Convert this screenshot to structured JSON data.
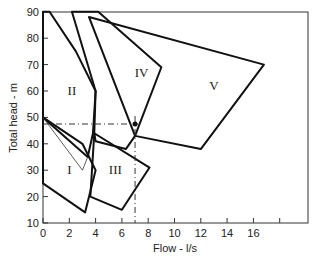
{
  "chart_data": {
    "type": "area",
    "title": "",
    "xlabel": "Flow - l/s",
    "ylabel": "Total head - m",
    "xlim": [
      0,
      18
    ],
    "ylim": [
      10,
      90
    ],
    "x_ticks": [
      "0",
      "2",
      "4",
      "6",
      "8",
      "10",
      "12",
      "14",
      "16",
      ""
    ],
    "y_ticks": [
      "10",
      "20",
      "30",
      "40",
      "50",
      "60",
      "70",
      "80",
      "90"
    ],
    "grid": false,
    "regions": [
      {
        "name": "I",
        "label_pos": [
          2.0,
          30
        ],
        "points": [
          [
            0,
            25
          ],
          [
            3.2,
            14
          ],
          [
            4.0,
            30
          ],
          [
            3.0,
            40
          ],
          [
            0,
            50
          ]
        ]
      },
      {
        "name": "II",
        "label_pos": [
          2.2,
          60
        ],
        "points": [
          [
            0,
            50
          ],
          [
            0,
            90
          ],
          [
            0.5,
            90
          ],
          [
            2.5,
            75
          ],
          [
            4.0,
            60
          ],
          [
            3.8,
            44
          ],
          [
            3.4,
            35
          ]
        ]
      },
      {
        "name": "III",
        "label_pos": [
          5.5,
          30
        ],
        "points": [
          [
            3.6,
            20
          ],
          [
            6.0,
            15
          ],
          [
            8.1,
            31
          ],
          [
            3.9,
            44
          ]
        ]
      },
      {
        "name": "IV",
        "label_pos": [
          7.5,
          67
        ],
        "points": [
          [
            3.9,
            44
          ],
          [
            4.0,
            41
          ],
          [
            6.3,
            38
          ],
          [
            7.0,
            43
          ],
          [
            9.0,
            69
          ],
          [
            4.2,
            90
          ],
          [
            2.2,
            90
          ],
          [
            4.0,
            60
          ]
        ]
      },
      {
        "name": "V",
        "label_pos": [
          13.0,
          62
        ],
        "points": [
          [
            7.0,
            43
          ],
          [
            12.0,
            38
          ],
          [
            16.8,
            70
          ],
          [
            3.5,
            88
          ]
        ]
      }
    ],
    "thin_line": {
      "points": [
        [
          0,
          50
        ],
        [
          3.0,
          30
        ],
        [
          3.4,
          35
        ]
      ]
    },
    "operating_point": {
      "x": 7.0,
      "y": 47.5
    },
    "guide_lines": {
      "horizontal_y": 47.5,
      "vertical_x": 7.0,
      "style": "dash-dot"
    }
  }
}
